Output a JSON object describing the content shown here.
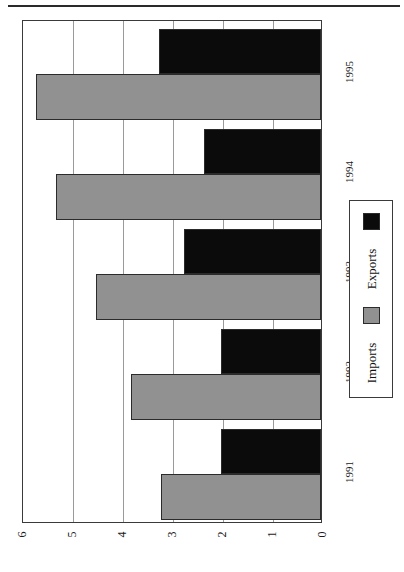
{
  "chart_data": {
    "type": "bar",
    "orientation": "horizontal-rotated",
    "title": "",
    "xlabel": "",
    "ylabel": "",
    "categories": [
      "1991",
      "1992",
      "1993",
      "1994",
      "1995"
    ],
    "series": [
      {
        "name": "Imports",
        "color": "#919191",
        "values": [
          3.2,
          3.8,
          4.5,
          5.3,
          5.7
        ]
      },
      {
        "name": "Exports",
        "color": "#0b0b0b",
        "values": [
          2.0,
          2.0,
          2.75,
          2.35,
          3.25
        ]
      }
    ],
    "value_axis": {
      "min": 0,
      "max": 6,
      "ticks": [
        "0",
        "1",
        "2",
        "3",
        "4",
        "5",
        "6"
      ],
      "direction": "right-to-left",
      "grid": true
    },
    "legend": {
      "position": "right",
      "entries": [
        {
          "label": "Imports",
          "color": "#919191"
        },
        {
          "label": "Exports",
          "color": "#0b0b0b"
        }
      ]
    }
  }
}
